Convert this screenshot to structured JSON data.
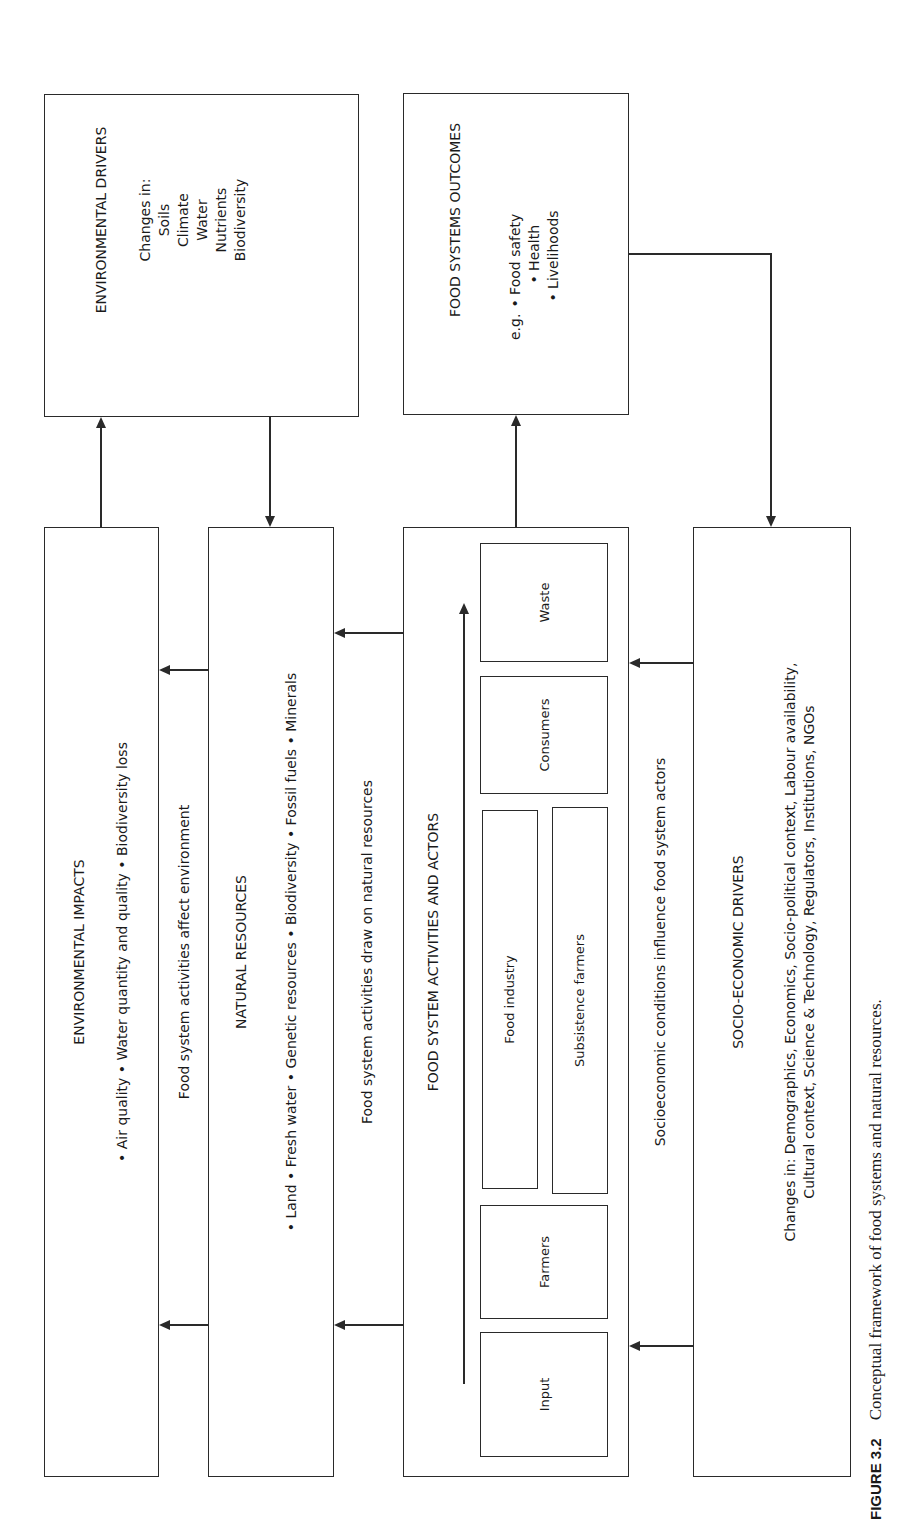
{
  "environmental_drivers": {
    "title": "ENVIRONMENTAL DRIVERS",
    "lines": [
      "Changes in:",
      "Soils",
      "Climate",
      "Water",
      "Nutrients",
      "Biodiversity"
    ]
  },
  "food_systems_outcomes": {
    "title": "FOOD SYSTEMS OUTCOMES",
    "prefix": "e.g.",
    "items": [
      "• Food safety",
      "• Health",
      "• Livelihoods"
    ]
  },
  "environmental_impacts": {
    "title": "ENVIRONMENTAL IMPACTS",
    "items_text": "• Air quality  •  Water quantity and quality  •  Biodiversity loss"
  },
  "gap_labels": {
    "affect_environment": "Food system activities affect environment",
    "draw_on_resources": "Food system activities draw on natural resources",
    "socio_influence": "Socioeconomic conditions influence food system actors"
  },
  "natural_resources": {
    "title": "NATURAL RESOURCES",
    "items_text": "• Land • Fresh water • Genetic resources • Biodiversity • Fossil fuels • Minerals"
  },
  "food_system_activities": {
    "title": "FOOD SYSTEM ACTIVITIES AND ACTORS",
    "actors": {
      "input": "Input",
      "farmers": "Farmers",
      "food_industry": "Food industry",
      "subsistence_farmers": "Subsistence farmers",
      "consumers": "Consumers",
      "waste": "Waste"
    }
  },
  "socio_economic_drivers": {
    "title": "SOCIO-ECONOMIC DRIVERS",
    "line1": "Changes in: Demographics, Economics, Socio-political context, Labour availability,",
    "line2": "Cultural context, Science & Technology, Regulators, Institutions, NGOs"
  },
  "caption": {
    "label": "FIGURE 3.2",
    "text": "Conceptual framework of food systems and natural resources."
  }
}
